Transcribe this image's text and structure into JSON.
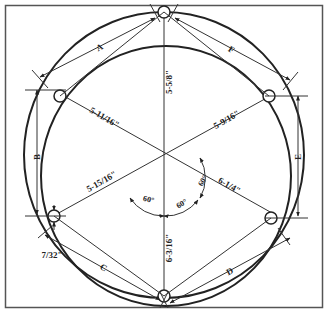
{
  "diagram": {
    "type": "bolt-circle-hole-pattern",
    "colors": {
      "line": "#222222",
      "frame": "#555555",
      "background": "#ffffff"
    },
    "radial_dimensions": [
      {
        "id": "top",
        "label": "5-5/8\""
      },
      {
        "id": "upper-left",
        "label": "5-11/16\""
      },
      {
        "id": "upper-right",
        "label": "5-9/16\""
      },
      {
        "id": "lower-left",
        "label": "5-15/16\""
      },
      {
        "id": "lower-right",
        "label": "6-1/4\""
      },
      {
        "id": "bottom",
        "label": "6-3/16\""
      }
    ],
    "angles": [
      {
        "id": "angle-right",
        "label": "60°"
      },
      {
        "id": "angle-lower-mid",
        "label": "60°"
      },
      {
        "id": "angle-lower-left",
        "label": "60°"
      }
    ],
    "chord_dimensions": [
      {
        "id": "A",
        "label": "A"
      },
      {
        "id": "B",
        "label": "B"
      },
      {
        "id": "C",
        "label": "C"
      },
      {
        "id": "D",
        "label": "D"
      },
      {
        "id": "E",
        "label": "E"
      },
      {
        "id": "F",
        "label": "F"
      }
    ],
    "hole_offset": {
      "label": "7/32\""
    }
  }
}
